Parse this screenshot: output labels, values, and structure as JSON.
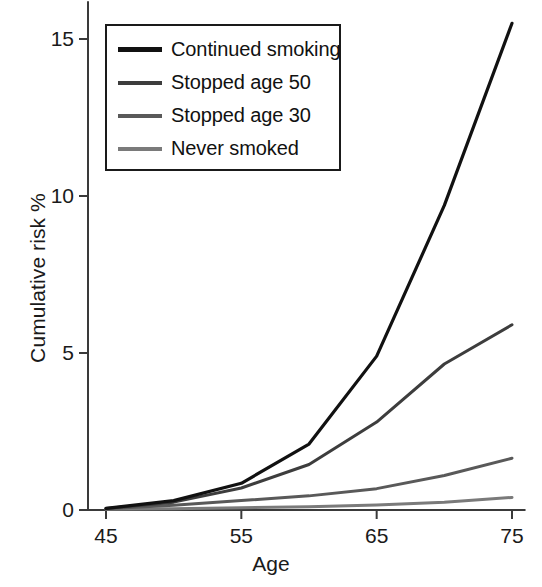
{
  "chart_data": {
    "type": "line",
    "title": "",
    "xlabel": "Age",
    "ylabel": "Cumulative risk %",
    "xlim": [
      45,
      76
    ],
    "ylim": [
      0,
      16.2
    ],
    "xticks": [
      45,
      55,
      65,
      75
    ],
    "yticks": [
      0,
      5,
      10,
      15
    ],
    "xtick_labels": [
      "45",
      "55",
      "65",
      "75"
    ],
    "ytick_labels": [
      "0",
      "5",
      "10",
      "15"
    ],
    "grid": false,
    "legend_position": "upper-left",
    "x": [
      45,
      50,
      55,
      60,
      65,
      70,
      75
    ],
    "series": [
      {
        "name": "Continued smoking",
        "color": "#111111",
        "width": 3.2,
        "values": [
          0.05,
          0.3,
          0.85,
          2.1,
          4.9,
          9.7,
          15.5
        ]
      },
      {
        "name": "Stopped age 50",
        "color": "#3d3d3d",
        "width": 3.0,
        "values": [
          0.05,
          0.25,
          0.7,
          1.45,
          2.8,
          4.65,
          5.9
        ]
      },
      {
        "name": "Stopped age 30",
        "color": "#595959",
        "width": 3.0,
        "values": [
          0.04,
          0.15,
          0.3,
          0.45,
          0.68,
          1.1,
          1.65
        ]
      },
      {
        "name": "Never smoked",
        "color": "#7a7a7a",
        "width": 3.0,
        "values": [
          0.02,
          0.04,
          0.07,
          0.1,
          0.16,
          0.25,
          0.4
        ]
      }
    ]
  },
  "legend": {
    "items": [
      {
        "label": "Continued smoking",
        "color": "#111111"
      },
      {
        "label": "Stopped age 50",
        "color": "#3d3d3d"
      },
      {
        "label": "Stopped age 30",
        "color": "#595959"
      },
      {
        "label": "Never smoked",
        "color": "#7a7a7a"
      }
    ]
  },
  "axes": {
    "axis_color": "#3a3a3a"
  }
}
